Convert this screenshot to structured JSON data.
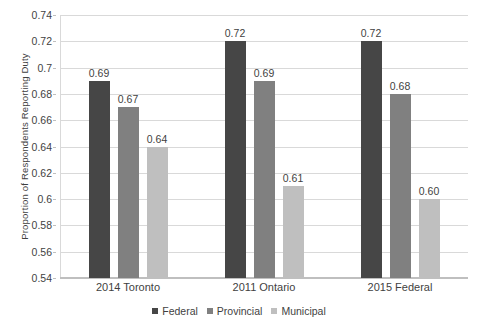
{
  "chart_data": {
    "type": "bar",
    "title": "",
    "xlabel": "",
    "ylabel": "Proportion of Respondents Reporting Duty",
    "categories": [
      "2014 Toronto",
      "2011 Ontario",
      "2015 Federal"
    ],
    "series": [
      {
        "name": "Federal",
        "color": "#464646",
        "values": [
          0.69,
          0.72,
          0.72
        ],
        "labels": [
          "0.69",
          "0.72",
          "0.72"
        ]
      },
      {
        "name": "Provincial",
        "color": "#808080",
        "values": [
          0.67,
          0.69,
          0.68
        ],
        "labels": [
          "0.67",
          "0.69",
          "0.68"
        ]
      },
      {
        "name": "Municipal",
        "color": "#bfbfbf",
        "values": [
          0.64,
          0.61,
          0.6
        ],
        "labels": [
          "0.64",
          "0.61",
          "0.60"
        ]
      }
    ],
    "ylim": [
      0.54,
      0.74
    ],
    "yticks": [
      0.54,
      0.56,
      0.58,
      0.6,
      0.62,
      0.64,
      0.66,
      0.68,
      0.7,
      0.72,
      0.74
    ],
    "ytick_labels": [
      "0.54",
      "0.56",
      "0.58",
      "0.6",
      "0.62",
      "0.64",
      "0.66",
      "0.68",
      "0.7",
      "0.72",
      "0.74"
    ],
    "grid": true,
    "legend_position": "bottom",
    "background": "#ffffff",
    "gridline_color": "#d9d9d9"
  }
}
